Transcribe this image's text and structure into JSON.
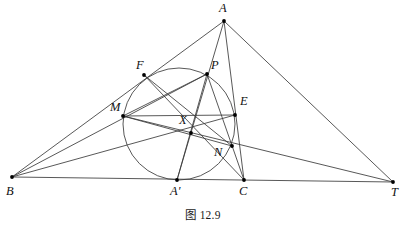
{
  "figure": {
    "caption": "图 12.9",
    "stroke_color": "#3a3a3a",
    "point_color": "#000000",
    "background_color": "#ffffff",
    "width": 406,
    "height": 226
  },
  "points": [
    {
      "id": "A",
      "label": "A",
      "x": 224,
      "y": 21,
      "label_x": 219,
      "label_y": 2
    },
    {
      "id": "B",
      "label": "B",
      "x": 12,
      "y": 177,
      "label_x": 6,
      "label_y": 185
    },
    {
      "id": "C",
      "label": "C",
      "x": 244,
      "y": 180,
      "label_x": 239,
      "label_y": 185
    },
    {
      "id": "T",
      "label": "T",
      "x": 393,
      "y": 182,
      "label_x": 391,
      "label_y": 186
    },
    {
      "id": "Ap",
      "label": "A′",
      "x": 177,
      "y": 180,
      "label_x": 170,
      "label_y": 185
    },
    {
      "id": "F",
      "label": "F",
      "x": 144,
      "y": 75,
      "label_x": 136,
      "label_y": 59
    },
    {
      "id": "P",
      "label": "P",
      "x": 207,
      "y": 74,
      "label_x": 211,
      "label_y": 59
    },
    {
      "id": "M",
      "label": "M",
      "x": 123,
      "y": 116,
      "label_x": 110,
      "label_y": 101
    },
    {
      "id": "E",
      "label": "E",
      "x": 235,
      "y": 115,
      "label_x": 240,
      "label_y": 95
    },
    {
      "id": "X",
      "label": "X",
      "x": 191,
      "y": 133,
      "label_x": 179,
      "label_y": 114
    },
    {
      "id": "N",
      "label": "N",
      "x": 232,
      "y": 146,
      "label_x": 214,
      "label_y": 146
    }
  ],
  "circle": {
    "name": "incircle",
    "cx": 179,
    "cy": 124,
    "r": 56
  },
  "segments": [
    {
      "name": "side-AB",
      "from": "A",
      "to": "B"
    },
    {
      "name": "side-BT",
      "from": "B",
      "to": "T"
    },
    {
      "name": "side-AC",
      "from": "A",
      "to": "C"
    },
    {
      "name": "cevian-A-Aprime",
      "from": "A",
      "to": "Ap"
    },
    {
      "name": "line-A-T",
      "from": "A",
      "to": "T"
    },
    {
      "name": "line-B-P",
      "from": "B",
      "to": "P"
    },
    {
      "name": "line-B-E",
      "from": "B",
      "to": "E"
    },
    {
      "name": "line-T-M",
      "from": "T",
      "to": "M"
    },
    {
      "name": "chord-M-P",
      "from": "M",
      "to": "P"
    },
    {
      "name": "chord-M-E",
      "from": "M",
      "to": "E"
    },
    {
      "name": "chord-M-N",
      "from": "M",
      "to": "N"
    },
    {
      "name": "chord-F-N",
      "from": "F",
      "to": "N"
    },
    {
      "name": "chord-P-Aprime",
      "from": "P",
      "to": "Ap"
    },
    {
      "name": "chord-F-C",
      "from": "F",
      "to": "C"
    },
    {
      "name": "chord-P-C",
      "from": "P",
      "to": "C"
    }
  ]
}
